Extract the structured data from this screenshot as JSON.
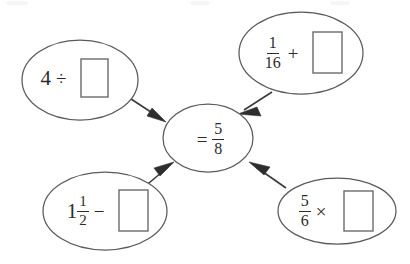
{
  "diagram": {
    "type": "fraction-operation-web",
    "background_color": "#ffffff",
    "stroke_color": "#5a5a5a",
    "text_color": "#2b2b2b",
    "center": {
      "id": "center-result",
      "equals_sign": "=",
      "fraction": {
        "numerator": "5",
        "denominator": "8"
      },
      "label": "= 5/8"
    },
    "nodes": [
      {
        "id": "top-left",
        "position": "top-left",
        "whole": "4",
        "operator": "÷",
        "operand": "box-placeholder",
        "label": "4 ÷ □"
      },
      {
        "id": "top-right",
        "position": "top-right",
        "fraction": {
          "numerator": "1",
          "denominator": "16"
        },
        "operator": "+",
        "operand": "box-placeholder",
        "label": "1/16 + □"
      },
      {
        "id": "bottom-left",
        "position": "bottom-left",
        "whole": "1",
        "fraction": {
          "numerator": "1",
          "denominator": "2"
        },
        "operator": "−",
        "operand": "box-placeholder",
        "label": "1 1/2 − □"
      },
      {
        "id": "bottom-right",
        "position": "bottom-right",
        "fraction": {
          "numerator": "5",
          "denominator": "6"
        },
        "operator": "×",
        "operand": "box-placeholder",
        "label": "5/6 × □"
      }
    ],
    "arrows": [
      {
        "id": "arrow-top-left-to-center",
        "from": "top-left",
        "to": "center-result",
        "direction": "down-right"
      },
      {
        "id": "arrow-top-right-to-center",
        "from": "top-right",
        "to": "center-result",
        "direction": "down-left"
      },
      {
        "id": "arrow-bottom-left-to-center",
        "from": "bottom-left",
        "to": "center-result",
        "direction": "up-right"
      },
      {
        "id": "arrow-bottom-right-to-center",
        "from": "bottom-right",
        "to": "center-result",
        "direction": "up-left"
      }
    ]
  }
}
